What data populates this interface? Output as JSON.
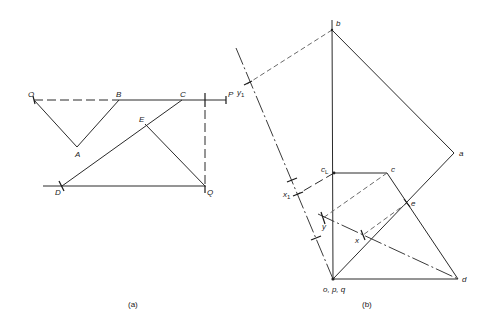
{
  "figure_a": {
    "caption": "(a)",
    "labels": {
      "O": "O",
      "B": "B",
      "C": "C",
      "P": "P",
      "E": "E",
      "A": "A",
      "D": "D",
      "Q": "Q"
    }
  },
  "figure_b": {
    "caption": "(b)",
    "labels": {
      "b": "b",
      "y1": "y",
      "y1_sub": "1",
      "a": "a",
      "cL": "c",
      "cL_sub": "L",
      "c": "c",
      "x1": "x",
      "x1_sub": "1",
      "e": "e",
      "y": "y",
      "x": "x",
      "opq": "o, p, q",
      "d": "d"
    }
  }
}
